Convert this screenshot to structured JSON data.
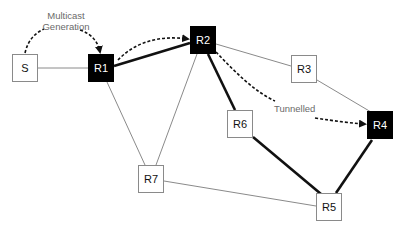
{
  "diagram": {
    "type": "network-topology",
    "nodes": [
      {
        "id": "S",
        "label": "S",
        "style": "white",
        "x": 12,
        "y": 54
      },
      {
        "id": "R1",
        "label": "R1",
        "style": "black",
        "x": 88,
        "y": 54
      },
      {
        "id": "R2",
        "label": "R2",
        "style": "black",
        "x": 190,
        "y": 26
      },
      {
        "id": "R3",
        "label": "R3",
        "style": "white",
        "x": 291,
        "y": 55
      },
      {
        "id": "R4",
        "label": "R4",
        "style": "black",
        "x": 367,
        "y": 111
      },
      {
        "id": "R5",
        "label": "R5",
        "style": "white",
        "x": 316,
        "y": 193
      },
      {
        "id": "R6",
        "label": "R6",
        "style": "white",
        "x": 227,
        "y": 110
      },
      {
        "id": "R7",
        "label": "R7",
        "style": "white",
        "x": 138,
        "y": 165
      }
    ],
    "edges": [
      {
        "from": "S",
        "to": "R1",
        "weight": "thin"
      },
      {
        "from": "R1",
        "to": "R2",
        "weight": "thick"
      },
      {
        "from": "R1",
        "to": "R7",
        "weight": "thin"
      },
      {
        "from": "R2",
        "to": "R7",
        "weight": "thin"
      },
      {
        "from": "R2",
        "to": "R3",
        "weight": "thin"
      },
      {
        "from": "R2",
        "to": "R6",
        "weight": "thick"
      },
      {
        "from": "R3",
        "to": "R4",
        "weight": "thin"
      },
      {
        "from": "R6",
        "to": "R5",
        "weight": "thick"
      },
      {
        "from": "R4",
        "to": "R5",
        "weight": "thick"
      },
      {
        "from": "R7",
        "to": "R5",
        "weight": "thin"
      }
    ],
    "annotations": {
      "multicast_line1": "Multicast",
      "multicast_line2": "Generation",
      "tunnelled": "Tunnelled"
    },
    "colors": {
      "thin_edge": "#8a8a8a",
      "thick_edge": "#111111",
      "annotation_text": "#6a6a6a",
      "router_highlight": "#000000"
    }
  }
}
